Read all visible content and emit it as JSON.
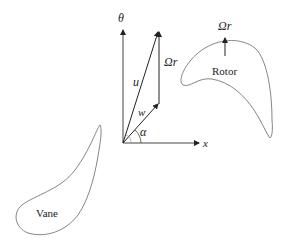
{
  "diagram": {
    "axes": {
      "theta_label": "θ",
      "x_label": "x"
    },
    "vectors": {
      "u_label": "u",
      "w_label": "w",
      "omega_r_label": "Ωr",
      "alpha_label": "α"
    },
    "rotor": {
      "label": "Rotor",
      "arrow_label": "Ωr"
    },
    "vane": {
      "label": "Vane"
    },
    "colors": {
      "stroke": "#222222",
      "blade_outline": "#666666",
      "background": "#ffffff"
    }
  }
}
